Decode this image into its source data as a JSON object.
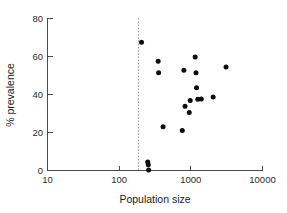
{
  "chart_data": {
    "type": "scatter",
    "title": "",
    "xlabel": "Population size",
    "ylabel": "% prevalence",
    "xscale": "log",
    "yscale": "linear",
    "xlim": [
      10,
      10000
    ],
    "ylim": [
      0,
      80
    ],
    "xticks": [
      10,
      100,
      1000,
      10000
    ],
    "xtick_labels": [
      "10",
      "100",
      "1000",
      "10000"
    ],
    "yticks": [
      0,
      20,
      40,
      60,
      80
    ],
    "ytick_labels": [
      "0",
      "20",
      "40",
      "60",
      "80"
    ],
    "grid": false,
    "legend": null,
    "annotations": [
      {
        "name": "threshold-line",
        "type": "vline",
        "x": 200,
        "style": "dashed",
        "color": "#9a9a9a"
      }
    ],
    "series": [
      {
        "name": "populations",
        "marker": "filled-circle",
        "color": "#0d0d0d",
        "points": [
          {
            "x": 205,
            "y": 67.5
          },
          {
            "x": 250,
            "y": 4.5
          },
          {
            "x": 255,
            "y": 3.0
          },
          {
            "x": 258,
            "y": 0.2
          },
          {
            "x": 350,
            "y": 57.5
          },
          {
            "x": 355,
            "y": 51.5
          },
          {
            "x": 410,
            "y": 23.0
          },
          {
            "x": 760,
            "y": 21.0
          },
          {
            "x": 800,
            "y": 52.8
          },
          {
            "x": 830,
            "y": 33.8
          },
          {
            "x": 950,
            "y": 30.5
          },
          {
            "x": 980,
            "y": 36.8
          },
          {
            "x": 1150,
            "y": 59.8
          },
          {
            "x": 1180,
            "y": 51.5
          },
          {
            "x": 1200,
            "y": 43.5
          },
          {
            "x": 1250,
            "y": 37.5
          },
          {
            "x": 1400,
            "y": 37.6
          },
          {
            "x": 2050,
            "y": 38.7
          },
          {
            "x": 3100,
            "y": 54.5
          }
        ]
      }
    ]
  },
  "axes": {
    "x_title": "Population size",
    "y_title": "% prevalence"
  }
}
